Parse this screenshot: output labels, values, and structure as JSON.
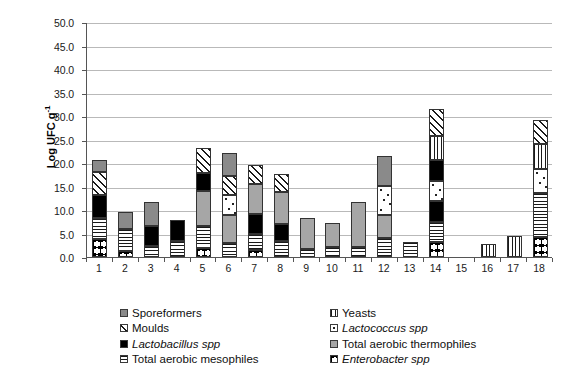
{
  "chart_data": {
    "type": "bar",
    "stacked": true,
    "title": "",
    "xlabel": "",
    "ylabel": "Log UFC g-1",
    "ylabel_display": "Log UFC g",
    "ylabel_sup": "-1",
    "ylim": [
      0,
      50
    ],
    "ytick_step": 5,
    "yticks": [
      "0.0",
      "5.0",
      "10.0",
      "15.0",
      "20.0",
      "25.0",
      "30.0",
      "35.0",
      "40.0",
      "45.0",
      "50.0"
    ],
    "grid": true,
    "legend_position": "bottom",
    "categories": [
      "1",
      "2",
      "3",
      "4",
      "5",
      "6",
      "7",
      "8",
      "9",
      "10",
      "11",
      "12",
      "13",
      "14",
      "15",
      "16",
      "17",
      "18"
    ],
    "series": [
      {
        "name": "Enterobacter spp",
        "key": "enterobacter",
        "italic": true,
        "values": [
          3.8,
          1.2,
          0.0,
          0.0,
          2.0,
          0.0,
          1.5,
          0.0,
          0.0,
          0.0,
          0.0,
          0.0,
          0.0,
          3.3,
          0.0,
          0.0,
          0.0,
          4.3
        ]
      },
      {
        "name": "Total aerobic mesophiles",
        "key": "mesophiles",
        "italic": false,
        "values": [
          4.4,
          4.8,
          2.4,
          3.5,
          4.5,
          3.0,
          3.5,
          3.4,
          1.6,
          2.2,
          2.2,
          4.0,
          3.3,
          4.2,
          0.0,
          0.0,
          0.0,
          9.3
        ]
      },
      {
        "name": "Lactobacillus spp",
        "key": "lactobacillus",
        "italic": true,
        "values": [
          4.9,
          0.0,
          4.3,
          4.3,
          0.0,
          0.0,
          4.2,
          3.6,
          0.0,
          0.0,
          0.0,
          0.0,
          0.0,
          4.5,
          0.0,
          0.0,
          0.0,
          0.0
        ]
      },
      {
        "name": "Total aerobic thermophiles",
        "key": "thermophiles",
        "italic": false,
        "values": [
          0.0,
          0.0,
          0.0,
          0.0,
          7.6,
          6.0,
          6.3,
          6.9,
          6.8,
          5.0,
          9.5,
          5.0,
          0.0,
          0.0,
          0.0,
          0.0,
          0.0,
          0.0
        ]
      },
      {
        "name": "Lactococcus spp",
        "key": "lactococcus",
        "italic": true,
        "values": [
          0.0,
          0.0,
          0.0,
          0.0,
          0.0,
          4.3,
          0.0,
          0.0,
          0.0,
          0.0,
          0.0,
          6.1,
          0.0,
          4.2,
          0.0,
          0.0,
          0.0,
          5.2
        ]
      },
      {
        "name": "Lactobacillus spp (upper)",
        "key": "lactobacillus",
        "italic": true,
        "hidden_legend": true,
        "values": [
          0.0,
          0.0,
          0.0,
          0.0,
          3.8,
          0.0,
          0.0,
          0.0,
          0.0,
          0.0,
          0.0,
          0.0,
          0.0,
          4.4,
          0.0,
          0.0,
          0.0,
          0.0
        ]
      },
      {
        "name": "Yeasts",
        "key": "yeasts",
        "italic": false,
        "values": [
          0.0,
          0.0,
          0.0,
          0.0,
          0.0,
          0.0,
          0.0,
          0.0,
          0.0,
          0.0,
          0.0,
          0.0,
          0.0,
          5.1,
          0.0,
          2.7,
          4.5,
          5.2
        ]
      },
      {
        "name": "Moulds",
        "key": "moulds",
        "italic": false,
        "values": [
          4.9,
          0.0,
          0.0,
          0.0,
          5.4,
          4.0,
          4.0,
          3.7,
          0.0,
          0.0,
          0.0,
          0.0,
          0.0,
          5.7,
          0.0,
          0.0,
          0.0,
          5.2
        ]
      },
      {
        "name": "Sporeformers",
        "key": "sporeformers",
        "italic": false,
        "values": [
          2.6,
          3.5,
          5.0,
          0.0,
          0.0,
          4.8,
          0.0,
          0.0,
          0.0,
          0.0,
          0.0,
          6.4,
          0.0,
          0.0,
          0.0,
          0.0,
          0.0,
          0.0
        ]
      }
    ],
    "totals": [
      20.6,
      9.5,
      11.7,
      7.8,
      23.3,
      22.1,
      19.5,
      17.6,
      8.4,
      7.2,
      11.7,
      21.5,
      3.3,
      31.4,
      0.0,
      2.7,
      4.5,
      29.2
    ]
  },
  "legend": {
    "left_column": [
      {
        "label": "Sporeformers",
        "key": "sporeformers",
        "italic": false
      },
      {
        "label": "Moulds",
        "key": "moulds",
        "italic": false
      },
      {
        "label": "Lactobacillus spp",
        "key": "lactobacillus",
        "italic": true
      },
      {
        "label": "Total aerobic mesophiles",
        "key": "mesophiles",
        "italic": false
      }
    ],
    "right_column": [
      {
        "label": "Yeasts",
        "key": "yeasts",
        "italic": false
      },
      {
        "label": "Lactococcus spp",
        "key": "lactococcus",
        "italic": true
      },
      {
        "label": "Total aerobic thermophiles",
        "key": "thermophiles",
        "italic": false
      },
      {
        "label": "Enterobacter spp",
        "key": "enterobacter",
        "italic": true
      }
    ]
  },
  "colors": {
    "sporeformers": "#8a8a8a",
    "thermophiles": "#a6a6a6",
    "lactobacillus": "#000000",
    "plot_border": "#555555",
    "gridline": "#b9b9b9",
    "background": "#ffffff"
  }
}
